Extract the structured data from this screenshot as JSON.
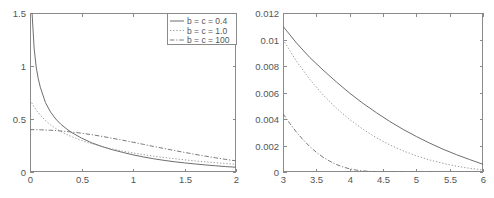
{
  "figure": {
    "title": "",
    "panel_count": 2,
    "background_color": "#ffffff",
    "axis_color": "#8a8a8a",
    "text_color": "#555555"
  },
  "chart_data": [
    {
      "type": "line",
      "title": "",
      "xlabel": "",
      "ylabel": "",
      "xlim": [
        0,
        2
      ],
      "ylim": [
        0,
        1.5
      ],
      "xticks": [
        "0",
        "0.5",
        "1",
        "1.5",
        "2"
      ],
      "xtick_values": [
        0,
        0.5,
        1,
        1.5,
        2
      ],
      "yticks": [
        "0",
        "0.5",
        "1",
        "1.5"
      ],
      "ytick_values": [
        0,
        0.5,
        1,
        1.5
      ],
      "grid": false,
      "legend_position": "upper right",
      "series": [
        {
          "name": "b = c = 0.4",
          "style": "solid",
          "color": "#6e6e6e",
          "x": [
            0.02,
            0.04,
            0.06,
            0.08,
            0.1,
            0.15,
            0.2,
            0.25,
            0.3,
            0.35,
            0.4,
            0.5,
            0.6,
            0.7,
            0.8,
            0.9,
            1.0,
            1.1,
            1.2,
            1.3,
            1.4,
            1.5,
            1.6,
            1.7,
            1.8,
            1.9,
            2.0
          ],
          "values": [
            1.5,
            1.17,
            0.99,
            0.88,
            0.8,
            0.655,
            0.565,
            0.5,
            0.45,
            0.41,
            0.375,
            0.32,
            0.275,
            0.24,
            0.21,
            0.185,
            0.162,
            0.142,
            0.125,
            0.11,
            0.097,
            0.086,
            0.076,
            0.067,
            0.059,
            0.051,
            0.045
          ]
        },
        {
          "name": "b = c = 1.0",
          "style": "dotted",
          "color": "#9a9a9a",
          "x": [
            0.0,
            0.05,
            0.1,
            0.15,
            0.2,
            0.25,
            0.3,
            0.35,
            0.4,
            0.5,
            0.6,
            0.7,
            0.8,
            0.9,
            1.0,
            1.1,
            1.2,
            1.3,
            1.4,
            1.5,
            1.6,
            1.7,
            1.8,
            1.9,
            2.0
          ],
          "values": [
            0.68,
            0.6,
            0.535,
            0.485,
            0.445,
            0.41,
            0.382,
            0.357,
            0.335,
            0.297,
            0.266,
            0.24,
            0.217,
            0.197,
            0.18,
            0.164,
            0.15,
            0.137,
            0.126,
            0.115,
            0.105,
            0.096,
            0.088,
            0.08,
            0.073
          ]
        },
        {
          "name": "b = c = 100",
          "style": "dashdot",
          "color": "#7a7a7a",
          "x": [
            0.0,
            0.1,
            0.2,
            0.3,
            0.4,
            0.5,
            0.6,
            0.7,
            0.8,
            0.9,
            1.0,
            1.1,
            1.2,
            1.3,
            1.4,
            1.5,
            1.6,
            1.7,
            1.8,
            1.9,
            2.0
          ],
          "values": [
            0.4,
            0.398,
            0.394,
            0.387,
            0.378,
            0.366,
            0.352,
            0.336,
            0.318,
            0.3,
            0.281,
            0.261,
            0.241,
            0.222,
            0.203,
            0.185,
            0.167,
            0.15,
            0.134,
            0.119,
            0.105
          ]
        }
      ]
    },
    {
      "type": "line",
      "title": "",
      "xlabel": "",
      "ylabel": "",
      "xlim": [
        3,
        6
      ],
      "ylim": [
        0,
        0.012
      ],
      "xticks": [
        "3",
        "3.5",
        "4",
        "4.5",
        "5",
        "5.5",
        "6"
      ],
      "xtick_values": [
        3,
        3.5,
        4,
        4.5,
        5,
        5.5,
        6
      ],
      "yticks": [
        "0",
        "0.002",
        "0.004",
        "0.006",
        "0.008",
        "0.01",
        "0.012"
      ],
      "ytick_values": [
        0,
        0.002,
        0.004,
        0.006,
        0.008,
        0.01,
        0.012
      ],
      "grid": false,
      "legend_position": "none",
      "series": [
        {
          "name": "b = c = 0.4",
          "style": "solid",
          "color": "#6e6e6e",
          "x": [
            3.0,
            3.2,
            3.4,
            3.6,
            3.8,
            4.0,
            4.2,
            4.4,
            4.6,
            4.8,
            5.0,
            5.2,
            5.4,
            5.6,
            5.8,
            6.0
          ],
          "values": [
            0.011,
            0.00975,
            0.00865,
            0.0077,
            0.0068,
            0.00595,
            0.00518,
            0.00448,
            0.00382,
            0.00322,
            0.00268,
            0.00218,
            0.00172,
            0.00131,
            0.00094,
            0.00058
          ]
        },
        {
          "name": "b = c = 1.0",
          "style": "dotted",
          "color": "#9a9a9a",
          "x": [
            3.0,
            3.2,
            3.4,
            3.6,
            3.8,
            4.0,
            4.2,
            4.4,
            4.6,
            4.8,
            5.0,
            5.2,
            5.4,
            5.6,
            5.8,
            6.0
          ],
          "values": [
            0.01,
            0.00838,
            0.007,
            0.00582,
            0.00482,
            0.00396,
            0.00322,
            0.00259,
            0.00205,
            0.0016,
            0.00122,
            0.00091,
            0.00065,
            0.00044,
            0.00028,
            0.00015
          ]
        },
        {
          "name": "b = c = 100",
          "style": "dashdot",
          "color": "#7a7a7a",
          "x": [
            3.0,
            3.1,
            3.2,
            3.3,
            3.4,
            3.5,
            3.6,
            3.7,
            3.8,
            3.9,
            4.0,
            4.1,
            4.2,
            4.4,
            4.6,
            4.8,
            5.0,
            5.4,
            5.8,
            6.0
          ],
          "values": [
            0.0044,
            0.00368,
            0.00302,
            0.00244,
            0.00193,
            0.00149,
            0.00112,
            0.00082,
            0.00057,
            0.00038,
            0.00024,
            0.00014,
            8e-05,
            2e-05,
            1e-05,
            5e-06,
            2e-06,
            0.0,
            0.0,
            0.0
          ]
        }
      ]
    }
  ]
}
